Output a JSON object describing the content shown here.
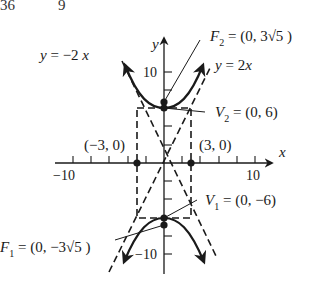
{
  "cropped_header": {
    "left_fragment": "36",
    "right_fragment": "9"
  },
  "axes": {
    "x_label": "x",
    "y_label": "y",
    "x_tick_labels": [
      "−10",
      "10"
    ],
    "y_tick_labels": [
      "10",
      "−10"
    ],
    "x_range": [
      -10,
      10
    ],
    "y_range": [
      -10,
      10
    ]
  },
  "asymptotes": {
    "neg": "y = −2 x",
    "pos": "y = 2 x"
  },
  "points": {
    "F2": {
      "name": "F",
      "sub": "2",
      "value": " = (0, 3√5 )"
    },
    "V2": {
      "name": "V",
      "sub": "2",
      "value": " = (0, 6)"
    },
    "V1": {
      "name": "V",
      "sub": "1",
      "value": " = (0, −6)"
    },
    "F1": {
      "name": "F",
      "sub": "1",
      "value": " = (0, −3√5 )"
    },
    "co_vertex_left": "(−3, 0)",
    "co_vertex_right": "(3, 0)"
  },
  "colors": {
    "ink": "#1a1a1a",
    "background": "#ffffff"
  }
}
